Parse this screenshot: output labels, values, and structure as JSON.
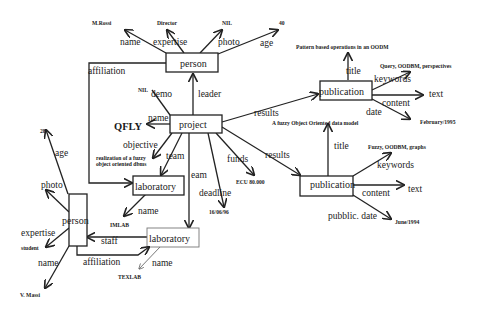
{
  "nodes": {
    "person_top": {
      "label": "person"
    },
    "project": {
      "label": "project"
    },
    "publication_1": {
      "label": "publication"
    },
    "publication_2": {
      "label": "publication"
    },
    "laboratory_1": {
      "label": "laboratory"
    },
    "laboratory_2": {
      "label": "laboratory"
    },
    "person_left": {
      "label": "person"
    }
  },
  "edges": {
    "person_top": {
      "name": "name",
      "expertise": "expertise",
      "photo": "photo",
      "age": "age",
      "affiliation": "affiliation"
    },
    "project": {
      "demo": "demo",
      "leader": "leader",
      "name": "name",
      "objective": "objective",
      "team": "team",
      "team2": "eam",
      "deadline": "deadline",
      "funds": "funds",
      "results1": "results",
      "results2": "results"
    },
    "publication_1": {
      "title": "title",
      "keywords": "keywords",
      "content": "content",
      "date": "date"
    },
    "publication_2": {
      "title": "title",
      "keywords": "keywords",
      "content": "content",
      "date": "pubblic. date"
    },
    "laboratory_1": {
      "name": "name"
    },
    "laboratory_2": {
      "name": "name",
      "staff": "staff"
    },
    "person_left": {
      "age": "age",
      "photo": "photo",
      "expertise": "expertise",
      "name": "name",
      "affiliation": "affiliation"
    }
  },
  "values": {
    "person_top_name": "M.Rossi",
    "person_top_expertise": "Director",
    "person_top_photo": "NIL",
    "person_top_age": "40",
    "project_demo": "NIL",
    "project_name": "QFLY",
    "project_objective_line1": "realization of a fuzzy",
    "project_objective_line2": "object oriented dbms",
    "project_funds": "ECU 80.000",
    "project_deadline": "16/06/96",
    "pub1_title": "Pattern based operations in an OODM",
    "pub1_keywords": "Query, OODBM, perspectives",
    "pub1_content": "text",
    "pub1_date": "February/1995",
    "pub2_title": "A fuzzy Object Oriented data model",
    "pub2_keywords": "Fuzzy, OODBM, graphs",
    "pub2_content": "text",
    "pub2_date": "June/1994",
    "lab1_name": "IMLAB",
    "lab2_name": "TEXLAB",
    "person_left_age": "28",
    "person_left_expertise": "student",
    "person_left_name": "V. Massi"
  }
}
